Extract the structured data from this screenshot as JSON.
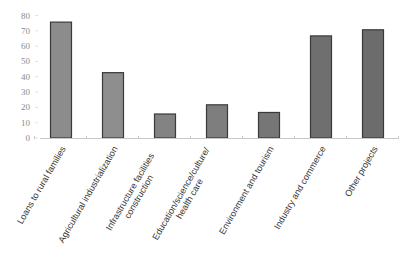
{
  "chart_data": {
    "type": "bar",
    "title": "",
    "xlabel": "",
    "ylabel": "",
    "ylim": [
      0,
      80
    ],
    "yticks": [
      0,
      10,
      20,
      30,
      40,
      50,
      60,
      70,
      80
    ],
    "grid": false,
    "legend": null,
    "categories": [
      "Loans to rural families",
      "Agricultural industrialization",
      "Infrastructure facilities construction",
      "Education/science/culture/ health care",
      "Environment and tourism",
      "Industry and commerce",
      "Other projects"
    ],
    "category_lines": [
      [
        "Loans to rural families"
      ],
      [
        "Agricultural industrialization"
      ],
      [
        "Infrastructure facilities",
        "construction"
      ],
      [
        "Education/science/culture/",
        "health care"
      ],
      [
        "Environment and tourism"
      ],
      [
        "Industry and commerce"
      ],
      [
        "Other projects"
      ]
    ],
    "values": [
      76,
      43,
      16,
      22,
      17,
      67,
      71
    ]
  },
  "style": {
    "bar_fills": [
      "#8c8c8c",
      "#8e8e8e",
      "#838383",
      "#7e7e7e",
      "#767676",
      "#6f6f6f",
      "#6c6c6c"
    ],
    "bar_stroke": "#3a3a3a",
    "axis_color": "#c8c8c8"
  }
}
